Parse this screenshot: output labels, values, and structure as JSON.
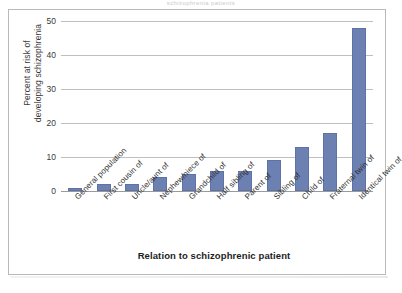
{
  "scan": {
    "top_cutoff_text": "schizophrenia  patients"
  },
  "chart_data": {
    "type": "bar",
    "title": "",
    "xlabel": "Relation to schizophrenic patient",
    "ylabel": "Percent at risk of developing schizophrenia",
    "ylabel_line1": "Percent at risk of",
    "ylabel_line2": "developing schizophrenia",
    "ylim": [
      0,
      50
    ],
    "yticks": [
      50,
      40,
      30,
      20,
      10,
      0
    ],
    "grid": true,
    "legend": "none",
    "bar_color": "#6c80b2",
    "categories": [
      "General population",
      "First cousin of",
      "Uncle/aunt of",
      "Nephew/niece of",
      "Grandchild of",
      "Half sibling of",
      "Parent of",
      "Sibling of",
      "Child of",
      "Fraternal twin of",
      "Identical twin of"
    ],
    "values": [
      1,
      2,
      2,
      4,
      5,
      6,
      6,
      9,
      13,
      17,
      48
    ]
  }
}
